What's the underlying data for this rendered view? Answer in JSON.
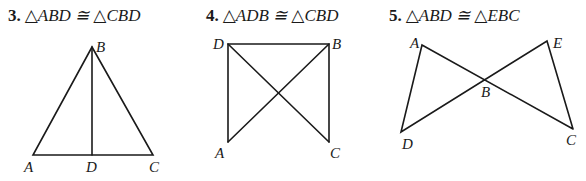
{
  "problems": [
    {
      "number": "3.",
      "statement": "△ABD ≅ △CBD",
      "labels": {
        "A": "A",
        "B": "B",
        "C": "C",
        "D": "D"
      }
    },
    {
      "number": "4.",
      "statement": "△ADB ≅ △CBD",
      "labels": {
        "A": "A",
        "B": "B",
        "C": "C",
        "D": "D"
      }
    },
    {
      "number": "5.",
      "statement": "△ABD ≅ △EBC",
      "labels": {
        "A": "A",
        "B": "B",
        "C": "C",
        "D": "D",
        "E": "E"
      }
    }
  ]
}
